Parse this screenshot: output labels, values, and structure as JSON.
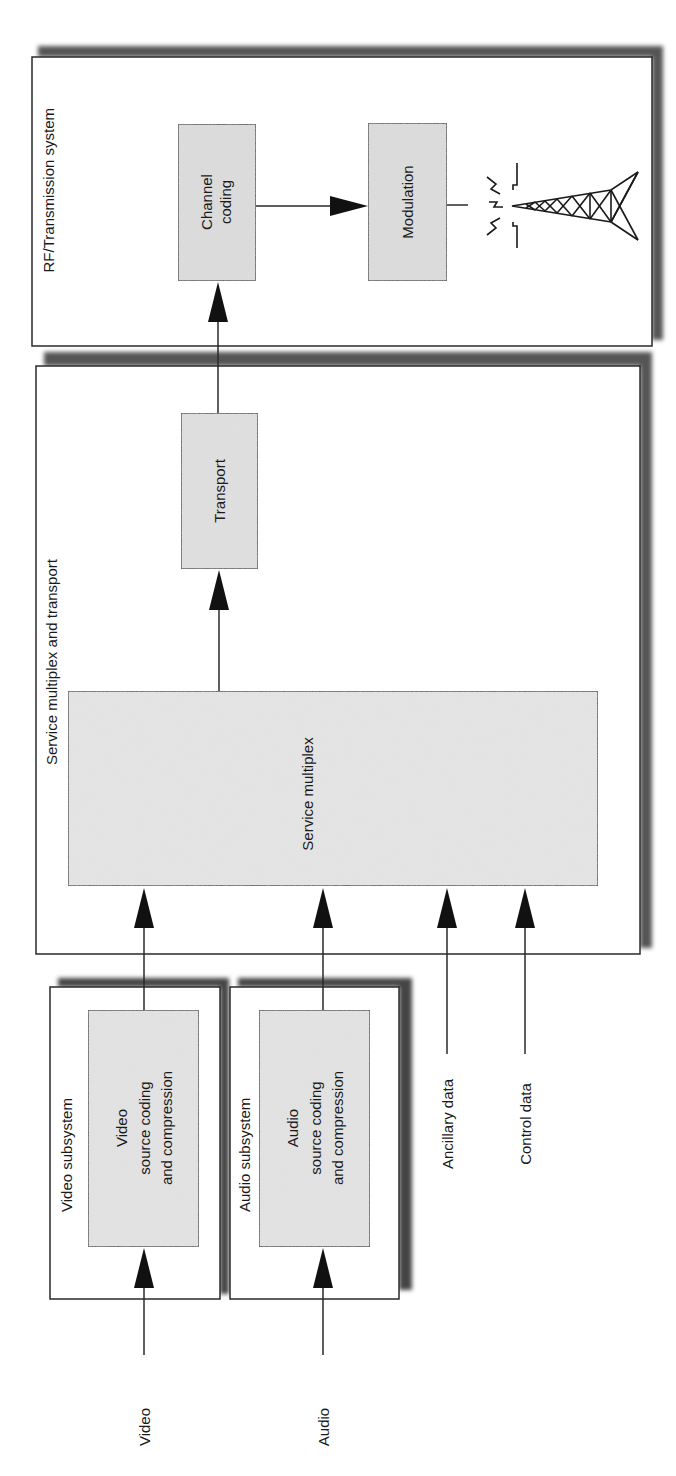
{
  "diagram": {
    "groups": {
      "rf": {
        "title": "RF/Transmission system"
      },
      "mux": {
        "title": "Service multiplex and transport"
      },
      "video": {
        "title": "Video subsystem"
      },
      "audio": {
        "title": "Audio subsystem"
      }
    },
    "blocks": {
      "channel_coding": {
        "lines": [
          "Channel",
          "coding"
        ]
      },
      "modulation": {
        "lines": [
          "Modulation"
        ]
      },
      "transport": {
        "lines": [
          "Transport"
        ]
      },
      "service_multiplex": {
        "lines": [
          "Service multiplex"
        ]
      },
      "video_coding": {
        "lines": [
          "Video",
          "source coding",
          "and compression"
        ]
      },
      "audio_coding": {
        "lines": [
          "Audio",
          "source coding",
          "and compression"
        ]
      }
    },
    "inputs": {
      "video": "Video",
      "audio": "Audio",
      "ancillary": "Ancillary data",
      "control": "Control data"
    },
    "icons": {
      "antenna": "transmission-tower-icon"
    },
    "colors": {
      "block_fill": "#dcdcdc",
      "stroke": "#2a2a2a",
      "shadow": "#555555"
    }
  }
}
